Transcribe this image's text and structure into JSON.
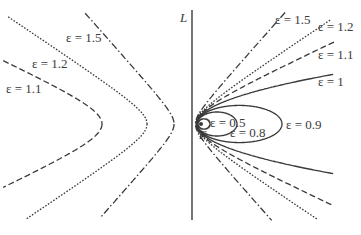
{
  "diagram": {
    "directrix_label": "L",
    "focus_label": "F",
    "directrix_distance": 1,
    "curves": [
      {
        "eccentricity": 0.5,
        "label": "ε = 0.5",
        "type": "ellipse",
        "style": "solid"
      },
      {
        "eccentricity": 0.8,
        "label": "ε = 0.8",
        "type": "ellipse",
        "style": "solid"
      },
      {
        "eccentricity": 0.9,
        "label": "ε = 0.9",
        "type": "ellipse",
        "style": "solid"
      },
      {
        "eccentricity": 1.0,
        "label": "ε = 1",
        "type": "parabola",
        "style": "solid"
      },
      {
        "eccentricity": 1.1,
        "label": "ε = 1.1",
        "type": "hyperbola",
        "style": "dashed"
      },
      {
        "eccentricity": 1.2,
        "label": "ε = 1.2",
        "type": "hyperbola",
        "style": "dotted"
      },
      {
        "eccentricity": 1.5,
        "label": "ε = 1.5",
        "type": "hyperbola",
        "style": "dashdot"
      }
    ],
    "left_branch_labels": [
      "ε = 1.5",
      "ε = 1.2",
      "ε = 1.1"
    ]
  }
}
